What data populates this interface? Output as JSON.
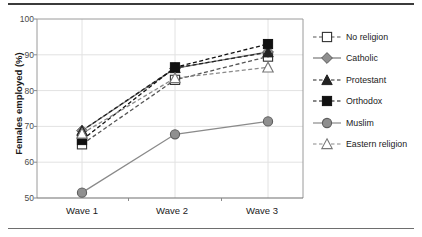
{
  "chart_data": {
    "type": "line",
    "title": "",
    "xlabel": "",
    "ylabel": "Females employed (%)",
    "categories": [
      "Wave 1",
      "Wave 2",
      "Wave 3"
    ],
    "ylim": [
      50,
      100
    ],
    "yticks": [
      50,
      60,
      70,
      80,
      90,
      100
    ],
    "grid": true,
    "legend_position": "right",
    "series": [
      {
        "name": "No religion",
        "values": [
          65.0,
          83.0,
          89.5
        ],
        "marker": "open-square",
        "line": "dashed",
        "color": "#555555"
      },
      {
        "name": "Catholic",
        "values": [
          68.8,
          86.2,
          90.8
        ],
        "marker": "diamond",
        "line": "solid",
        "color": "#777777"
      },
      {
        "name": "Protestant",
        "values": [
          68.8,
          86.3,
          90.7
        ],
        "marker": "filled-triangle",
        "line": "dashed",
        "color": "#222222"
      },
      {
        "name": "Orthodox",
        "values": [
          66.2,
          86.5,
          93.0
        ],
        "marker": "filled-square",
        "line": "dashed",
        "color": "#111111"
      },
      {
        "name": "Muslim",
        "values": [
          51.5,
          67.8,
          71.4
        ],
        "marker": "filled-circle",
        "line": "solid",
        "color": "#8a8a8a"
      },
      {
        "name": "Eastern religion",
        "values": [
          68.0,
          83.5,
          86.5
        ],
        "marker": "open-triangle",
        "line": "dashed",
        "color": "#8a8a8a"
      }
    ]
  },
  "axis": {
    "y_tick_labels": [
      "100",
      "90",
      "80",
      "70",
      "60",
      "50"
    ],
    "x_tick_labels": [
      "Wave 1",
      "Wave 2",
      "Wave 3"
    ],
    "y_title": "Females employed (%)"
  },
  "legend": {
    "items": [
      {
        "label": "No religion"
      },
      {
        "label": "Catholic"
      },
      {
        "label": "Protestant"
      },
      {
        "label": "Orthodox"
      },
      {
        "label": "Muslim"
      },
      {
        "label": "Eastern religion"
      }
    ]
  },
  "colors": {
    "frame": "#9a9a9a",
    "grid": "#e2e2e2",
    "text": "#1a1a1a",
    "rule": "#3b3b3b"
  }
}
